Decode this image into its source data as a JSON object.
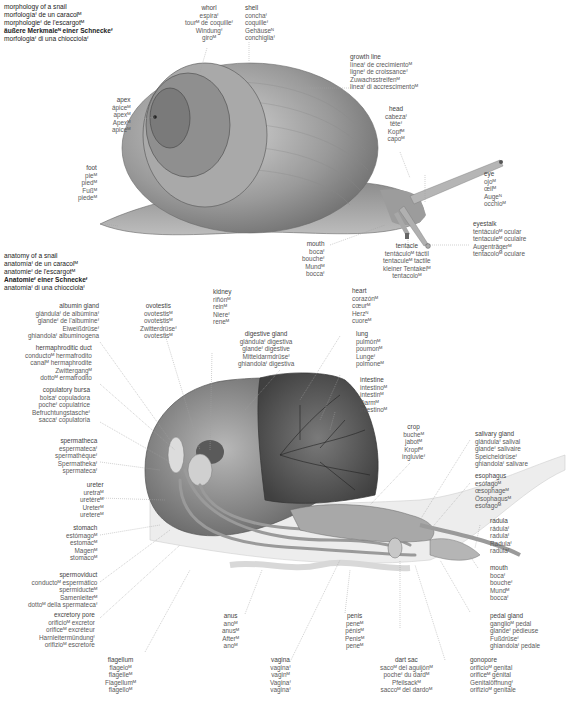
{
  "morphology": {
    "title": [
      "morphology of a snail",
      "morfologíaᶠ de un caracolᴹ",
      "morphologieᶠ de l'escargotᴹ",
      "äußere Merkmaleᴺ einer Schneckeᶠ",
      "morfologiaᶠ di una chiocciolaᶠ"
    ],
    "labels": {
      "whorl": [
        "whorl",
        "espiraᶠ",
        "tourᴹ de coquilleᶠ",
        "Windungᶠ",
        "giroᴹ"
      ],
      "shell": [
        "shell",
        "conchaᶠ",
        "coquilleᶠ",
        "Gehäuseᴺ",
        "conchigliaᶠ"
      ],
      "growth_line": [
        "growth line",
        "líneaᶠ de crecimientoᴹ",
        "ligneᶠ de croissanceᶠ",
        "Zuwachsstreifenᴹ",
        "lineaᶠ di accrescimentoᴹ"
      ],
      "apex": [
        "apex",
        "ápiceᴹ",
        "apexᴹ",
        "Apexᴹ",
        "apiceᴹ"
      ],
      "head": [
        "head",
        "cabezaᶠ",
        "têteᶠ",
        "Kopfᴹ",
        "capoᴹ"
      ],
      "foot": [
        "foot",
        "pieᴹ",
        "piedᴹ",
        "Fußᴹ",
        "piedeᴹ"
      ],
      "eye": [
        "eye",
        "ojoᴹ",
        "œilᴹ",
        "Augeᴺ",
        "occhioᴹ"
      ],
      "eyestalk": [
        "eyestalk",
        "tentáculoᴹ ocular",
        "tentaculeᴹ oculaire",
        "Augenträgerᴹ",
        "tentacoloᴹ oculare"
      ],
      "mouth": [
        "mouth",
        "bocaᶠ",
        "boucheᶠ",
        "Mundᴹ",
        "boccaᶠ"
      ],
      "tentacle": [
        "tentacle",
        "tentáculoᴹ táctil",
        "tentaculeᴹ tactile",
        "kleiner Tentakelᴹ",
        "tentacoloᴹ"
      ]
    }
  },
  "anatomy": {
    "title": [
      "anatomy of a snail",
      "anatomíaᶠ de un caracolᴹ",
      "anatomieᶠ de l'escargotᴹ",
      "Anatomieᶠ einer Schneckeᶠ",
      "anatomiaᶠ di una chiocciolaᶠ"
    ],
    "labels": {
      "albumin_gland": [
        "albumin gland",
        "glándulaᶠ de albúminaᶠ",
        "glandeᶠ de l'albumineᶠ",
        "Eiweißdrüseᶠ",
        "ghiandolaᶠ albuminogena"
      ],
      "ovotestis": [
        "ovotestis",
        "ovotestisᴹ",
        "ovotestisᴹ",
        "Zwitterdrüseᶠ",
        "ovotestisᴹ"
      ],
      "kidney": [
        "kidney",
        "riñónᴹ",
        "reinᴹ",
        "Niereᶠ",
        "reneᴹ"
      ],
      "heart": [
        "heart",
        "corazónᴹ",
        "cœurᴹ",
        "Herzᴺ",
        "cuoreᴹ"
      ],
      "hermaphroditic_duct": [
        "hermaphroditic duct",
        "conductoᴹ hermafrodito",
        "canalᴹ hermaphrodite",
        "Zwittergangᴹ",
        "dottoᴹ ermafrodito"
      ],
      "digestive_gland": [
        "digestive gland",
        "glándulaᶠ digestiva",
        "glandeᶠ digestive",
        "Mitteldarmdrüseᶠ",
        "ghiandolaᶠ digestiva"
      ],
      "lung": [
        "lung",
        "pulmónᴹ",
        "poumonᴹ",
        "Lungeᶠ",
        "polmoneᴹ"
      ],
      "copulatory_bursa": [
        "copulatory bursa",
        "bolsaᶠ copuladora",
        "pocheᶠ copulatrice",
        "Befruchtungstascheᶠ",
        "saccaᶠ copulatoria"
      ],
      "intestine": [
        "intestine",
        "intestinoᴹ",
        "intestinᴹ",
        "Darmᴹ",
        "intestinoᴹ"
      ],
      "spermatheca": [
        "spermatheca",
        "espermatecaᶠ",
        "spermathèqueᶠ",
        "Spermathekaᶠ",
        "spermatecaᶠ"
      ],
      "crop": [
        "crop",
        "bucheᴹ",
        "jabotᴹ",
        "Kropfᴹ",
        "ingluvieᶠ"
      ],
      "salivary_gland": [
        "salivary gland",
        "glándulaᶠ salival",
        "glandeᶠ salivaire",
        "Speicheldrüseᶠ",
        "ghiandolaᶠ salivare"
      ],
      "ureter": [
        "ureter",
        "uretraᴹ",
        "uretèreᴹ",
        "Ureterᴹ",
        "uretereᴹ"
      ],
      "esophagus": [
        "esophagus",
        "esófagoᴹ",
        "œsophageᴹ",
        "Ösophagusᴹ",
        "esofagoᴹ"
      ],
      "stomach": [
        "stomach",
        "estómagoᴹ",
        "estomacᴹ",
        "Magenᴹ",
        "stomacoᴹ"
      ],
      "radula": [
        "radula",
        "rádulaᶠ",
        "radulaᶠ",
        "Radulaᶠ",
        "radulaᶠ"
      ],
      "spermoviduct": [
        "spermoviduct",
        "conductoᴹ espermático",
        "spermiducteᴹ",
        "Samenleiterᴹ",
        "dottoᴹ della spermatecaᶠ"
      ],
      "mouth": [
        "mouth",
        "bocaᶠ",
        "boucheᶠ",
        "Mundᴹ",
        "boccaᶠ"
      ],
      "excretory_pore": [
        "excretory pore",
        "orificioᴹ excretor",
        "orificeᴹ excréteur",
        "Harnleitermündungᶠ",
        "orifizioᴹ escretore"
      ],
      "pedal_gland": [
        "pedal gland",
        "ganglioᴹ pedal",
        "glandeᶠ pédieuse",
        "Fußdrüseᶠ",
        "ghiandolaᶠ pedale"
      ],
      "anus": [
        "anus",
        "anoᴹ",
        "anusᴹ",
        "Afterᴹ",
        "anoᴹ"
      ],
      "penis": [
        "penis",
        "peneᴹ",
        "pénisᴹ",
        "Penisᴹ",
        "peneᴹ"
      ],
      "flagellum": [
        "flagellum",
        "flageloᴹ",
        "flagelleᴹ",
        "Flagellumᴹ",
        "flagelloᴹ"
      ],
      "vagina": [
        "vagina",
        "vaginaᶠ",
        "vaginᴹ",
        "Vaginaᶠ",
        "vaginaᶠ"
      ],
      "dart_sac": [
        "dart sac",
        "sacoᴹ del aguijónᴹ",
        "pocheᶠ du dardᴹ",
        "Pfeilsackᴹ",
        "saccoᴹ del dardoᴹ"
      ],
      "gonopore": [
        "gonopore",
        "orificioᴹ genital",
        "orificeᴹ génital",
        "Genitalöffnungᶠ",
        "orifizioᴹ genitale"
      ]
    }
  },
  "colors": {
    "text": "#5a5a5a",
    "title_text": "#222222",
    "leader_line": "#9a9a9a",
    "shell_dark": "#6e6e6e",
    "shell_light": "#c9c9c9",
    "body_gray": "#8a8a8a",
    "organ_dark": "#4a4a4a",
    "organ_light": "#d6d6d6"
  }
}
